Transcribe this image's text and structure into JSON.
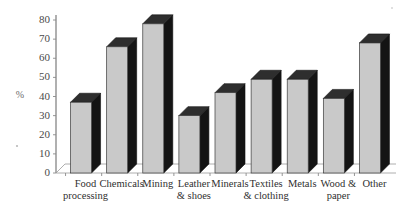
{
  "chart_data": {
    "type": "bar",
    "title": "",
    "subtitle": "",
    "xlabel": "",
    "ylabel": "%",
    "ylim": [
      0,
      80
    ],
    "ytick_step": 10,
    "yticks": [
      0,
      10,
      20,
      30,
      40,
      50,
      60,
      70,
      80
    ],
    "ytick_labels": [
      "0",
      "10",
      "20",
      "30",
      "40",
      "50",
      "60",
      "70",
      "80"
    ],
    "grid": false,
    "legend": null,
    "style": "3d-columns",
    "categories": [
      "Food processing",
      "Chemicals",
      "Mining",
      "Leather & shoes",
      "Minerals",
      "Textiles & clothing",
      "Metals",
      "Wood & paper",
      "Other"
    ],
    "category_lines": [
      [
        "Food",
        "processing"
      ],
      [
        "Chemicals",
        ""
      ],
      [
        "Mining",
        ""
      ],
      [
        "Leather",
        "& shoes"
      ],
      [
        "Minerals",
        ""
      ],
      [
        "Textiles",
        "& clothing"
      ],
      [
        "Metals",
        ""
      ],
      [
        "Wood &",
        "paper"
      ],
      [
        "Other",
        ""
      ]
    ],
    "values": [
      37,
      66,
      78,
      30,
      42,
      49,
      49,
      39,
      68
    ],
    "annotations": []
  },
  "colors": {
    "bar_front": "#c9c9c9",
    "bar_side": "#141414",
    "bar_top": "#2e2e2e",
    "axis": "#6f6f6f",
    "text": "#2f2f2f",
    "background": "#ffffff"
  }
}
